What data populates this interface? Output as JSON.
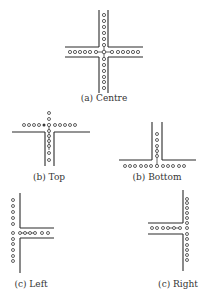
{
  "figure": {
    "panels": [
      {
        "id": "centre",
        "label": "(a) Centre"
      },
      {
        "id": "top",
        "label": "(b) Top"
      },
      {
        "id": "bottom",
        "label": "(b) Bottom"
      },
      {
        "id": "left",
        "label": "(c) Left"
      },
      {
        "id": "right",
        "label": "(c) Right"
      }
    ]
  },
  "colors": {
    "wall": "#2a2a2a",
    "dot": "#3a3a3a",
    "background": "#ffffff"
  }
}
